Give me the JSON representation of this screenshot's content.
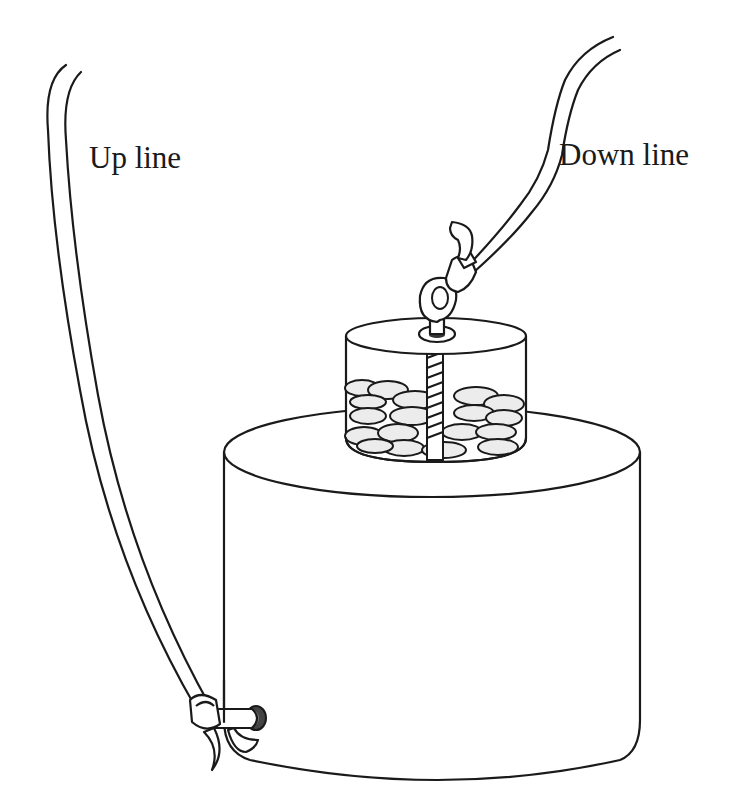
{
  "figure": {
    "type": "line-art illustration",
    "background_color": "#ffffff",
    "stroke_color": "#1a1a1a"
  },
  "labels": {
    "up_line": "Up line",
    "down_line": "Down line"
  },
  "components": [
    {
      "id": "up-line",
      "description": "double-stroke rope rising from left knot at base of large cylinder"
    },
    {
      "id": "down-line",
      "description": "double-stroke rope rising to upper right from eye bolt on bait container"
    },
    {
      "id": "bait-container",
      "description": "small transparent cylinder filled with bait pellets and a threaded center rod"
    },
    {
      "id": "eye-bolt",
      "description": "eye bolt on top of bait container with rope knot"
    },
    {
      "id": "main-cylinder",
      "description": "large cylinder base"
    },
    {
      "id": "side-grommet",
      "description": "dark ring on lower left side of main cylinder where up line is tied"
    }
  ]
}
